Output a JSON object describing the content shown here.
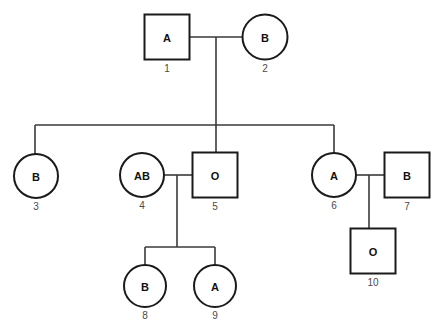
{
  "diagram": {
    "type": "pedigree",
    "background_color": "#ffffff",
    "line_color": "#3a3a3a",
    "shape_stroke_color": "#1a1a1a",
    "shape_fill_color": "#ffffff",
    "label_color": "#111111",
    "id_color": "#4a4a4a"
  },
  "legend": {
    "square_meaning": "male",
    "circle_meaning": "female"
  },
  "individuals": [
    {
      "id": "1",
      "label": "A",
      "shape": "square",
      "cx": 167,
      "cy": 37,
      "size": 45,
      "generation": 1
    },
    {
      "id": "2",
      "label": "B",
      "shape": "circle",
      "cx": 265,
      "cy": 37,
      "size": 45,
      "generation": 1
    },
    {
      "id": "3",
      "label": "B",
      "shape": "circle",
      "cx": 36,
      "cy": 176,
      "size": 44,
      "generation": 2
    },
    {
      "id": "4",
      "label": "AB",
      "shape": "circle",
      "cx": 142,
      "cy": 175,
      "size": 44,
      "generation": 2
    },
    {
      "id": "5",
      "label": "O",
      "shape": "square",
      "cx": 215,
      "cy": 175,
      "size": 45,
      "generation": 2
    },
    {
      "id": "6",
      "label": "A",
      "shape": "circle",
      "cx": 334,
      "cy": 175,
      "size": 44,
      "generation": 2
    },
    {
      "id": "7",
      "label": "B",
      "shape": "square",
      "cx": 407,
      "cy": 175,
      "size": 45,
      "generation": 2
    },
    {
      "id": "8",
      "label": "B",
      "shape": "circle",
      "cx": 145,
      "cy": 286,
      "size": 42,
      "generation": 3
    },
    {
      "id": "9",
      "label": "A",
      "shape": "circle",
      "cx": 215,
      "cy": 286,
      "size": 42,
      "generation": 3
    },
    {
      "id": "10",
      "label": "O",
      "shape": "square",
      "cx": 373,
      "cy": 251,
      "size": 45,
      "generation": 3
    }
  ],
  "connections": {
    "matings": [
      {
        "name": "mating-1-2",
        "partners": [
          "1",
          "2"
        ],
        "y": 37,
        "x_start": 190,
        "x_end": 243
      },
      {
        "name": "mating-4-5",
        "partners": [
          "4",
          "5"
        ],
        "y": 175,
        "x_start": 164,
        "x_end": 193
      },
      {
        "name": "mating-6-7",
        "partners": [
          "6",
          "7"
        ],
        "y": 175,
        "x_start": 356,
        "x_end": 385
      }
    ],
    "descent_lines": [
      {
        "name": "descent-gen1",
        "x": 216,
        "y_start": 37,
        "y_end": 153
      },
      {
        "name": "descent-gen2-left",
        "x": 177,
        "y_start": 175,
        "y_end": 247
      },
      {
        "name": "descent-gen2-right",
        "x": 369,
        "y_start": 175,
        "y_end": 230
      }
    ],
    "sibship_bars": [
      {
        "name": "sibship-bar-gen2",
        "y": 125,
        "x_start": 35,
        "x_end": 334,
        "drops": [
          {
            "x": 35,
            "y_end": 154
          },
          {
            "x": 334,
            "y_end": 153
          }
        ]
      },
      {
        "name": "sibship-bar-gen3",
        "y": 247,
        "x_start": 145,
        "x_end": 215,
        "drops": [
          {
            "x": 145,
            "y_end": 265
          },
          {
            "x": 215,
            "y_end": 265
          }
        ]
      }
    ]
  }
}
